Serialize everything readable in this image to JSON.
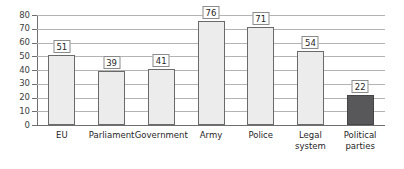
{
  "chart_data": {
    "type": "bar",
    "title": "",
    "subtitle": "",
    "xlabel": "",
    "ylabel": "",
    "ylim": [
      0,
      80
    ],
    "yticks": [
      0,
      10,
      20,
      30,
      40,
      50,
      60,
      70,
      80
    ],
    "grid": true,
    "legend": false,
    "legend_position": "none",
    "categories": [
      "EU",
      "Parliament",
      "Government",
      "Army",
      "Police",
      "Legal\nsystem",
      "Political\nparties"
    ],
    "values": [
      51,
      39,
      41,
      76,
      71,
      54,
      22
    ],
    "data_labels": [
      "51",
      "39",
      "41",
      "76",
      "71",
      "54",
      "22"
    ],
    "highlight_index": 6,
    "colors": {
      "bar_fill": "#ececec",
      "bar_border": "#6a6a6a",
      "highlight_fill": "#58585a",
      "highlight_border": "#44444a",
      "gridline": "#b3b3b3",
      "axis": "#6f6f6f",
      "label_text": "#1f1f1f",
      "tick_text": "#3d3d3d",
      "callout_border": "#8a8a8a",
      "background": "#ffffff"
    }
  }
}
